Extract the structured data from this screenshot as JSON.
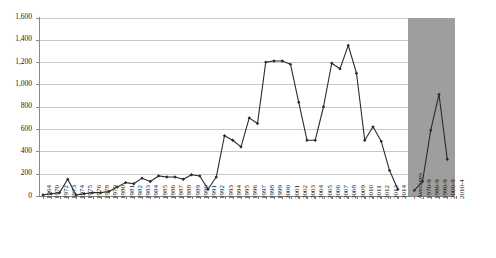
{
  "chart_data": {
    "type": "line",
    "title": "",
    "xlabel": "",
    "ylabel": "",
    "ylim": [
      0,
      1600
    ],
    "ytick_step": 200,
    "grid": true,
    "legend": "none",
    "marker": "diamond",
    "line_color": "#2b2b2b",
    "shaded_panel_color": "#9e9e9e",
    "ytick_labels": [
      "0",
      "200",
      "400",
      "600",
      "800",
      "1,000",
      "1,200",
      "1,400",
      "1,600"
    ],
    "ytick_values": [
      0,
      200,
      400,
      600,
      800,
      1000,
      1200,
      1400,
      1600
    ],
    "categories": [
      "1964",
      "1970",
      "1972",
      "1973",
      "1974",
      "1975",
      "1976",
      "1978",
      "1979",
      "1980",
      "1981",
      "1982",
      "1983",
      "1984",
      "1985",
      "1986",
      "1987",
      "1988",
      "1989",
      "1990",
      "1991",
      "1992",
      "1993",
      "1994",
      "1995",
      "1996",
      "1997",
      "1998",
      "1999",
      "2000",
      "2001",
      "2002",
      "2003",
      "2004",
      "2005",
      "2006",
      "2007",
      "2008",
      "2009",
      "2010",
      "2011",
      "2012",
      "2013",
      "2014"
    ],
    "values": [
      10,
      20,
      30,
      150,
      10,
      20,
      30,
      30,
      40,
      80,
      120,
      110,
      160,
      130,
      180,
      170,
      170,
      150,
      190,
      180,
      60,
      170,
      540,
      500,
      440,
      700,
      650,
      1200,
      1210,
      1210,
      1180,
      840,
      500,
      500,
      800,
      1190,
      1140,
      1350,
      1100,
      500,
      620,
      490,
      230,
      60
    ],
    "averages_section": {
      "header_label": "Averages",
      "categories": [
        "1970-9",
        "1980-9",
        "1990-9",
        "2000-9",
        "2010-4"
      ],
      "values": [
        50,
        130,
        590,
        910,
        330
      ],
      "shaded": true
    }
  }
}
